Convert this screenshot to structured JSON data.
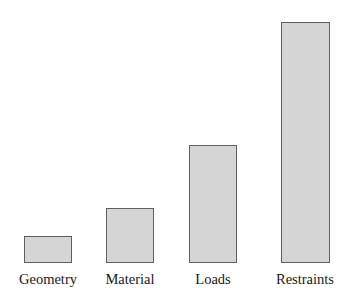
{
  "chart_data": {
    "type": "bar",
    "title": "",
    "subtitle": "",
    "xlabel": "",
    "ylabel": "",
    "categories": [
      "Geometry",
      "Material",
      "Loads",
      "Restraints"
    ],
    "values": [
      11,
      23,
      49,
      100
    ],
    "ylim": [
      0,
      100
    ],
    "grid": false,
    "legend": false,
    "legend_position": "none",
    "annotations": [],
    "tick_labels": {
      "x": [
        "Geometry",
        "Material",
        "Loads",
        "Restraints"
      ],
      "y": []
    },
    "series": [
      {
        "name": "Modeling effort",
        "values": [
          11,
          23,
          49,
          100
        ]
      }
    ]
  },
  "style": {
    "bar_fill": "#d5d5d5",
    "bar_border": "#5f5f5f",
    "background": "#ffffff",
    "label_color": "#1a1a1a"
  },
  "bars": [
    {
      "label": "Geometry",
      "value": 11
    },
    {
      "label": "Material",
      "value": 23
    },
    {
      "label": "Loads",
      "value": 49
    },
    {
      "label": "Restraints",
      "value": 100
    }
  ]
}
